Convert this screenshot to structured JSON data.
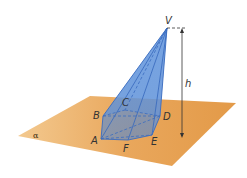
{
  "diagram": {
    "type": "pyramid-on-plane",
    "plane_label": "α",
    "apex_label": "V",
    "height_label": "h",
    "base_vertices": [
      "A",
      "B",
      "C",
      "D",
      "E",
      "F"
    ],
    "colors": {
      "plane": "#e8a55a",
      "pyramid_fill": "#5b8fd6",
      "pyramid_edge": "#3a6cc0",
      "height_line": "#333333"
    }
  }
}
